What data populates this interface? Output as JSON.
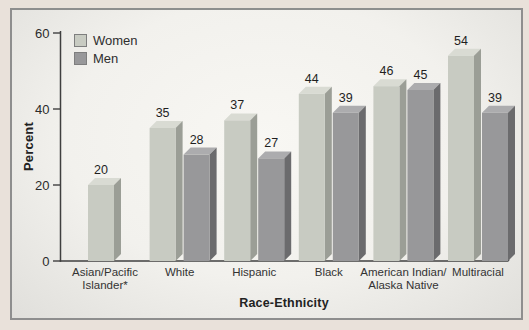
{
  "page": {
    "background": "#e9e1da"
  },
  "figure": {
    "background": "#f2f1ed",
    "border_color": "#8e8e8e"
  },
  "legend": {
    "position": "top-left",
    "items": [
      {
        "label": "Women",
        "color": "#c8cbc2",
        "border": "#7e7e7e"
      },
      {
        "label": "Men",
        "color": "#98989a",
        "border": "#7e7e7e"
      }
    ]
  },
  "chart_data": {
    "type": "bar",
    "style": "3d",
    "title": "",
    "xlabel": "Race-Ethnicity",
    "ylabel": "Percent",
    "ylim": [
      0,
      60
    ],
    "yticks": [
      0,
      20,
      40,
      60
    ],
    "grid": false,
    "legend_position": "top-left",
    "categories": [
      "Asian/Pacific Islander*",
      "White",
      "Hispanic",
      "Black",
      "American Indian/Alaska Native",
      "Multiracial"
    ],
    "category_label_lines": [
      [
        "Asian/Pacific",
        "Islander*"
      ],
      [
        "White"
      ],
      [
        "Hispanic"
      ],
      [
        "Black"
      ],
      [
        "American Indian/",
        "Alaska Native"
      ],
      [
        "Multiracial"
      ]
    ],
    "series": [
      {
        "name": "Women",
        "values": [
          20,
          35,
          37,
          44,
          46,
          54
        ],
        "colors": {
          "front": "#c8cbc2",
          "top": "#d9dbd3",
          "side": "#9b9e96"
        }
      },
      {
        "name": "Men",
        "values": [
          null,
          28,
          27,
          39,
          45,
          39
        ],
        "colors": {
          "front": "#98989a",
          "top": "#acacae",
          "side": "#6b6b6d"
        }
      }
    ],
    "value_labels_shown": true,
    "axis_color": "#3f3f3f",
    "text_color": "#2b2b2b"
  }
}
